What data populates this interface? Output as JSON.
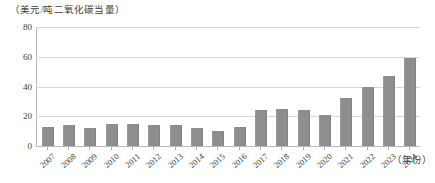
{
  "chart_data": {
    "type": "bar",
    "title": "",
    "subtitle": "",
    "ylabel": "（美元/吨二氧化碳当量）",
    "xlabel": "（年份）",
    "ylim": [
      0,
      80
    ],
    "yticks": [
      0,
      20,
      40,
      60,
      80
    ],
    "grid": true,
    "legend": false,
    "legend_position": "none",
    "bar_color": "#8e8e8e",
    "grid_color": "#d8d8d8",
    "axis_color": "#b9b9b9",
    "categories": [
      "2007",
      "2008",
      "2009",
      "2010",
      "2011",
      "2012",
      "2013",
      "2014",
      "2015",
      "2016",
      "2017",
      "2018",
      "2019",
      "2020",
      "2021",
      "2022",
      "2023",
      "2024"
    ],
    "values": [
      13,
      14,
      12,
      15,
      15,
      14,
      14,
      12,
      10,
      13,
      24,
      25,
      24,
      21,
      32,
      40,
      47,
      59
    ]
  }
}
